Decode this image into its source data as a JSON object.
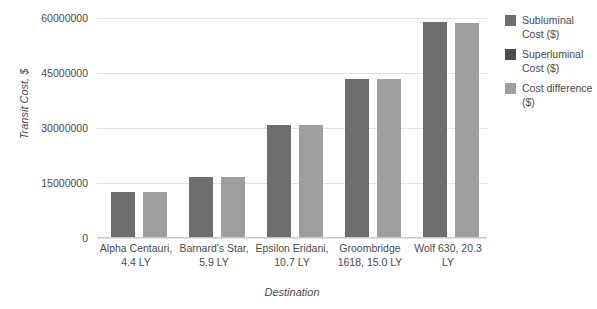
{
  "chart_data": {
    "type": "bar",
    "title": "",
    "xlabel": "Destination",
    "ylabel": "Transit Cost, $",
    "ylim": [
      0,
      60000000
    ],
    "yticks": [
      0,
      15000000,
      30000000,
      45000000,
      60000000
    ],
    "ytick_labels": [
      "0",
      "15000000",
      "30000000",
      "45000000",
      "60000000"
    ],
    "grid": true,
    "legend_position": "right",
    "categories": [
      "Alpha Centauri, 4.4 LY",
      "Barnard's Star, 5.9 LY",
      "Epsilon Eridani, 10.7 LY",
      "Groombridge 1618, 15.0 LY",
      "Wolf 630, 20.3 LY"
    ],
    "series": [
      {
        "name": "Subluminal Cost ($)",
        "color": "#6e6e6e",
        "values": [
          12300000,
          16500000,
          30600000,
          43200000,
          58600000
        ]
      },
      {
        "name": "Superluminal Cost ($)",
        "color": "#4d4d4d",
        "values": [
          0,
          0,
          0,
          0,
          0
        ]
      },
      {
        "name": "Cost difference ($)",
        "color": "#9e9e9e",
        "values": [
          12200000,
          16400000,
          30500000,
          43000000,
          58400000
        ]
      }
    ]
  },
  "legend": {
    "items": [
      {
        "label": "Subluminal Cost ($)",
        "color": "#6e6e6e"
      },
      {
        "label": "Superluminal Cost ($)",
        "color": "#4d4d4d"
      },
      {
        "label": "Cost difference ($)",
        "color": "#9e9e9e"
      }
    ]
  },
  "axes": {
    "y_title": "Transit Cost, $",
    "x_title": "Destination"
  }
}
